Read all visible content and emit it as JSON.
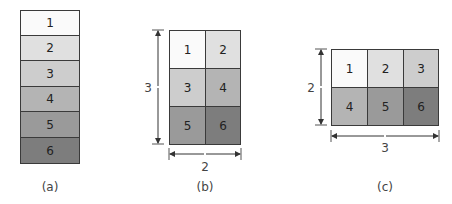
{
  "figure": {
    "panels": [
      {
        "id": "a",
        "caption": "(a)",
        "layout": "6 x 1",
        "cells": [
          {
            "label": "1",
            "color": "#fafafa"
          },
          {
            "label": "2",
            "color": "#e0e0e0"
          },
          {
            "label": "3",
            "color": "#cdcdcd"
          },
          {
            "label": "4",
            "color": "#b4b4b4"
          },
          {
            "label": "5",
            "color": "#9a9a9a"
          },
          {
            "label": "6",
            "color": "#7d7d7d"
          }
        ]
      },
      {
        "id": "b",
        "caption": "(b)",
        "layout": "3 x 2",
        "height_label": "3",
        "width_label": "2",
        "cells": [
          {
            "label": "1",
            "color": "#fafafa"
          },
          {
            "label": "2",
            "color": "#e0e0e0"
          },
          {
            "label": "3",
            "color": "#cdcdcd"
          },
          {
            "label": "4",
            "color": "#b4b4b4"
          },
          {
            "label": "5",
            "color": "#9a9a9a"
          },
          {
            "label": "6",
            "color": "#7d7d7d"
          }
        ]
      },
      {
        "id": "c",
        "caption": "(c)",
        "layout": "2 x 3",
        "height_label": "2",
        "width_label": "3",
        "cells": [
          {
            "label": "1",
            "color": "#fafafa"
          },
          {
            "label": "2",
            "color": "#e0e0e0"
          },
          {
            "label": "3",
            "color": "#cdcdcd"
          },
          {
            "label": "4",
            "color": "#b4b4b4"
          },
          {
            "label": "5",
            "color": "#9a9a9a"
          },
          {
            "label": "6",
            "color": "#7d7d7d"
          }
        ]
      }
    ]
  }
}
